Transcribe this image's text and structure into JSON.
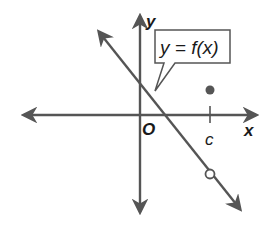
{
  "diagram": {
    "type": "function-graph",
    "axes": {
      "x_label": "x",
      "y_label": "y",
      "origin_label": "O"
    },
    "callout": {
      "text": "y = f(x)"
    },
    "tick": {
      "label": "c"
    },
    "elements": [
      {
        "kind": "line",
        "description": "decreasing line with arrows both ends",
        "slope": "negative"
      },
      {
        "kind": "open-circle",
        "description": "hole on line at x = c"
      },
      {
        "kind": "filled-point",
        "description": "defined value f(c) above x-axis at x = c"
      }
    ],
    "colors": {
      "stroke": "#555555",
      "text": "#1a1a1a",
      "background": "#ffffff"
    }
  }
}
